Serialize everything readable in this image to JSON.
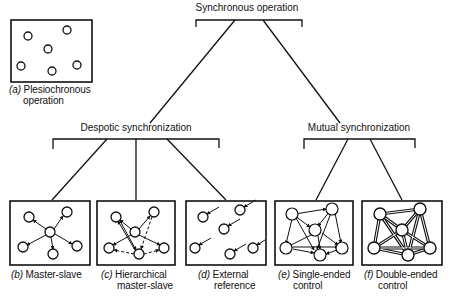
{
  "root": {
    "title": "Synchronous operation"
  },
  "branches": [
    {
      "id": "despotic",
      "title": "Despotic synchronization"
    },
    {
      "id": "mutual",
      "title": "Mutual synchronization"
    }
  ],
  "panels": [
    {
      "id": "a",
      "marker": "(a)",
      "line1": "Plesiochronous",
      "line2": "operation"
    },
    {
      "id": "b",
      "marker": "(b)",
      "line1": "Master-slave",
      "line2": ""
    },
    {
      "id": "c",
      "marker": "(c)",
      "line1": "Hierarchical",
      "line2": "master-slave"
    },
    {
      "id": "d",
      "marker": "(d)",
      "line1": "External",
      "line2": "reference"
    },
    {
      "id": "e",
      "marker": "(e)",
      "line1": "Single-ended",
      "line2": "control"
    },
    {
      "id": "f",
      "marker": "(f)",
      "line1": "Double-ended",
      "line2": "control"
    }
  ],
  "style": {
    "ink": "#111111",
    "paper": "#ffffff"
  }
}
